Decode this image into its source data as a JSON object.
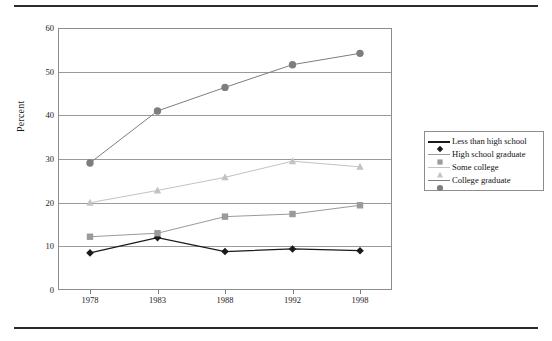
{
  "figure": {
    "has_top_rule": true,
    "has_bottom_rule": true
  },
  "chart_data": {
    "type": "line",
    "title": "",
    "xlabel": "",
    "ylabel": "Percent",
    "categories": [
      "1978",
      "1983",
      "1988",
      "1992",
      "1998"
    ],
    "x_values": [
      1978,
      1983,
      1988,
      1992,
      1998
    ],
    "ylim": [
      0,
      60
    ],
    "yticks": [
      0,
      10,
      20,
      30,
      40,
      50,
      60
    ],
    "ytick_labels": [
      "0",
      "10",
      "20",
      "30",
      "40",
      "50",
      "60"
    ],
    "grid": "horizontal",
    "legend_position": "right-outside",
    "series": [
      {
        "name": "Less than high school",
        "values": [
          8.5,
          12.0,
          8.8,
          9.4,
          9.0
        ],
        "color": "#1a1a1a",
        "marker": "diamond"
      },
      {
        "name": "High school graduate",
        "values": [
          12.2,
          13.0,
          16.8,
          17.4,
          19.4
        ],
        "color": "#9a9a9a",
        "marker": "square"
      },
      {
        "name": "Some college",
        "values": [
          20.0,
          22.8,
          25.8,
          29.5,
          28.2
        ],
        "color": "#c3c3c3",
        "marker": "triangle"
      },
      {
        "name": "College graduate",
        "values": [
          29.1,
          41.0,
          46.4,
          51.6,
          54.2
        ],
        "color": "#7e7e7e",
        "marker": "circle"
      }
    ]
  }
}
